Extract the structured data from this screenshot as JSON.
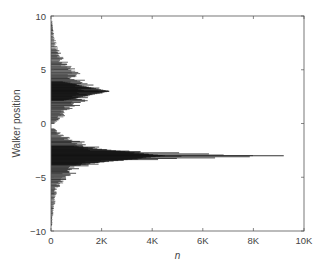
{
  "chart_data": {
    "type": "scatter",
    "title": "",
    "xlabel": "n",
    "ylabel": "Walker position",
    "xlim": [
      0,
      10000
    ],
    "ylim": [
      -10,
      10
    ],
    "xticks": [
      0,
      2000,
      4000,
      6000,
      8000,
      10000
    ],
    "xtick_labels": [
      "0",
      "2K",
      "4K",
      "6K",
      "8K",
      "10K"
    ],
    "yticks": [
      -10,
      -5,
      0,
      5,
      10
    ],
    "ytick_labels": [
      "−10",
      "−5",
      "0",
      "5",
      "10"
    ],
    "grid": false,
    "legend": null,
    "series": [
      {
        "name": "upper lobe",
        "converges_to": 3,
        "envelope": [
          {
            "y": 9.5,
            "n_end": 60
          },
          {
            "y": 8.0,
            "n_end": 150
          },
          {
            "y": 7.0,
            "n_end": 300
          },
          {
            "y": 6.0,
            "n_end": 550
          },
          {
            "y": 5.0,
            "n_end": 1000
          },
          {
            "y": 4.0,
            "n_end": 1600
          },
          {
            "y": 3.0,
            "n_end": 2300
          },
          {
            "y": 2.0,
            "n_end": 1400
          },
          {
            "y": 1.0,
            "n_end": 700
          },
          {
            "y": 0.0,
            "n_end": 200
          }
        ]
      },
      {
        "name": "lower lobe",
        "converges_to": -3,
        "envelope": [
          {
            "y": -0.5,
            "n_end": 150
          },
          {
            "y": -1.0,
            "n_end": 500
          },
          {
            "y": -1.5,
            "n_end": 1000
          },
          {
            "y": -2.0,
            "n_end": 1800
          },
          {
            "y": -2.5,
            "n_end": 2800
          },
          {
            "y": -3.0,
            "n_end": 9200
          },
          {
            "y": -3.5,
            "n_end": 2600
          },
          {
            "y": -4.0,
            "n_end": 1500
          },
          {
            "y": -5.0,
            "n_end": 700
          },
          {
            "y": -6.0,
            "n_end": 300
          },
          {
            "y": -7.0,
            "n_end": 200
          },
          {
            "y": -8.0,
            "n_end": 120
          },
          {
            "y": -9.5,
            "n_end": 50
          }
        ]
      }
    ]
  }
}
